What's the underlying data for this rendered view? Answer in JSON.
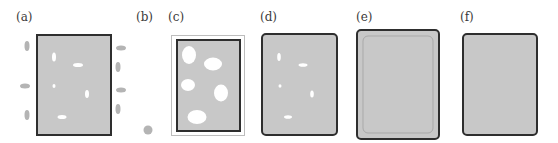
{
  "colors": {
    "fill": "#c8c8c8",
    "stroke": "#2e2e2e",
    "satellite": "#b4b4b4",
    "outer_frame": "#bdbdbd",
    "hole": "#ffffff",
    "inner_frame_e": "#a9a9a9"
  },
  "panels": [
    {
      "id": "a",
      "label": "(a)"
    },
    {
      "id": "b",
      "label": "(b)"
    },
    {
      "id": "c",
      "label": "(c)"
    },
    {
      "id": "d",
      "label": "(d)"
    },
    {
      "id": "e",
      "label": "(e)"
    },
    {
      "id": "f",
      "label": "(f)"
    }
  ]
}
